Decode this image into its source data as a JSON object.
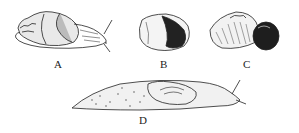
{
  "figure": {
    "panels": [
      {
        "id": "A",
        "label": "A",
        "subject": "snail-shell-extended-body"
      },
      {
        "id": "B",
        "label": "B",
        "subject": "snail-shell-aperture-view"
      },
      {
        "id": "C",
        "label": "C",
        "subject": "snail-shell-side-view"
      },
      {
        "id": "D",
        "label": "D",
        "subject": "slug"
      }
    ]
  }
}
